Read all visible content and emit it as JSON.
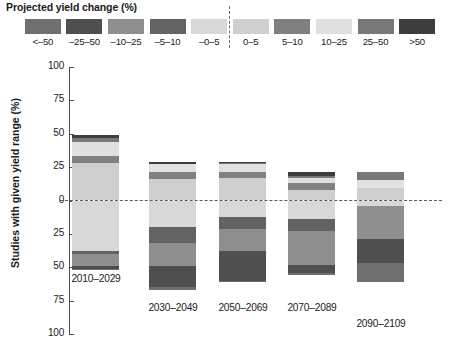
{
  "legend": {
    "title": "Projected yield change (%)",
    "classes": [
      {
        "label": "<–50",
        "color": "#6f6f6f"
      },
      {
        "label": "–25–50",
        "color": "#4f4f4f"
      },
      {
        "label": "–10–25",
        "color": "#8f8f8f"
      },
      {
        "label": "–5–10",
        "color": "#636363"
      },
      {
        "label": "–0–5",
        "color": "#d8d8d8"
      },
      {
        "label": "0–5",
        "color": "#cfcfcf"
      },
      {
        "label": "5–10",
        "color": "#808080"
      },
      {
        "label": "10–25",
        "color": "#e0e0e0"
      },
      {
        "label": "25–50",
        "color": "#787878"
      },
      {
        "label": ">50",
        "color": "#3d3d3d"
      }
    ],
    "divider": "dashed-separator"
  },
  "axes": {
    "ylabel": "Studies with given yield range (%)",
    "yticks": [
      "100",
      "75",
      "50",
      "25",
      "0",
      "25",
      "50",
      "75",
      "100"
    ],
    "ylim": [
      -100,
      100
    ],
    "zero_line": "0"
  },
  "chart_data": {
    "type": "bar",
    "title": "Projected yield change (%)",
    "xlabel": "",
    "ylabel": "Studies with given yield range (%)",
    "ylim": [
      -100,
      100
    ],
    "grid": false,
    "legend_position": "top",
    "stacked": true,
    "diverging": true,
    "note": "Positive values stack upward from 0 (yield increases); negative values stack downward from 0 (yield decreases).",
    "categories": [
      "2010–2029",
      "2030–2049",
      "2050–2069",
      "2070–2089",
      "2090–2109"
    ],
    "series": [
      {
        "name": ">50",
        "color": "#3d3d3d",
        "values": [
          2,
          2,
          1,
          3,
          0
        ]
      },
      {
        "name": "25–50",
        "color": "#787878",
        "values": [
          3,
          0,
          1,
          1,
          0
        ]
      },
      {
        "name": "10–25",
        "color": "#e0e0e0",
        "values": [
          11,
          6,
          6,
          4,
          6
        ]
      },
      {
        "name": "5–10",
        "color": "#808080",
        "values": [
          5,
          5,
          4,
          5,
          0
        ]
      },
      {
        "name": "0–5",
        "color": "#cfcfcf",
        "values": [
          28,
          16,
          17,
          8,
          9
        ]
      },
      {
        "name": "–0–5",
        "color": "#d8d8d8",
        "values": [
          -38,
          -20,
          -12,
          -14,
          -4
        ]
      },
      {
        "name": "–5–10",
        "color": "#636363",
        "values": [
          -2,
          -12,
          -9,
          -9,
          0
        ]
      },
      {
        "name": "–10–25",
        "color": "#8f8f8f",
        "values": [
          -9,
          -17,
          -17,
          -25,
          -25
        ]
      },
      {
        "name": "–25–50",
        "color": "#4f4f4f",
        "values": [
          -2,
          -16,
          -22,
          -6,
          -18
        ]
      },
      {
        "name": "<–50",
        "color": "#6f6f6f",
        "values": [
          -1,
          -2,
          -1,
          -2,
          -14
        ]
      }
    ],
    "bars": [
      {
        "category": "2010–2029",
        "positive_total": 49,
        "negative_total": 52,
        "positive_stack": [
          {
            "class": "0–5",
            "value": 28,
            "color": "#cfcfcf"
          },
          {
            "class": "5–10",
            "value": 5,
            "color": "#808080"
          },
          {
            "class": "10–25",
            "value": 11,
            "color": "#e0e0e0"
          },
          {
            "class": "25–50",
            "value": 3,
            "color": "#787878"
          },
          {
            "class": ">50",
            "value": 2,
            "color": "#3d3d3d"
          }
        ],
        "negative_stack": [
          {
            "class": "–0–5",
            "value": 38,
            "color": "#d8d8d8"
          },
          {
            "class": "–5–10",
            "value": 2,
            "color": "#636363"
          },
          {
            "class": "–10–25",
            "value": 9,
            "color": "#8f8f8f"
          },
          {
            "class": "–25–50",
            "value": 2,
            "color": "#4f4f4f"
          },
          {
            "class": "<–50",
            "value": 1,
            "color": "#6f6f6f"
          }
        ]
      },
      {
        "category": "2030–2049",
        "positive_total": 29,
        "negative_total": 67,
        "positive_stack": [
          {
            "class": "0–5",
            "value": 16,
            "color": "#cfcfcf"
          },
          {
            "class": "5–10",
            "value": 5,
            "color": "#808080"
          },
          {
            "class": "10–25",
            "value": 6,
            "color": "#e0e0e0"
          },
          {
            "class": ">50",
            "value": 2,
            "color": "#3d3d3d"
          }
        ],
        "negative_stack": [
          {
            "class": "–0–5",
            "value": 20,
            "color": "#d8d8d8"
          },
          {
            "class": "–5–10",
            "value": 12,
            "color": "#636363"
          },
          {
            "class": "–10–25",
            "value": 17,
            "color": "#8f8f8f"
          },
          {
            "class": "–25–50",
            "value": 16,
            "color": "#4f4f4f"
          },
          {
            "class": "<–50",
            "value": 2,
            "color": "#6f6f6f"
          }
        ]
      },
      {
        "category": "2050–2069",
        "positive_total": 29,
        "negative_total": 61,
        "positive_stack": [
          {
            "class": "0–5",
            "value": 17,
            "color": "#cfcfcf"
          },
          {
            "class": "5–10",
            "value": 4,
            "color": "#808080"
          },
          {
            "class": "10–25",
            "value": 6,
            "color": "#e0e0e0"
          },
          {
            "class": "25–50",
            "value": 1,
            "color": "#787878"
          },
          {
            "class": ">50",
            "value": 1,
            "color": "#3d3d3d"
          }
        ],
        "negative_stack": [
          {
            "class": "–0–5",
            "value": 12,
            "color": "#d8d8d8"
          },
          {
            "class": "–5–10",
            "value": 9,
            "color": "#636363"
          },
          {
            "class": "–10–25",
            "value": 17,
            "color": "#8f8f8f"
          },
          {
            "class": "–25–50",
            "value": 22,
            "color": "#4f4f4f"
          },
          {
            "class": "<–50",
            "value": 1,
            "color": "#6f6f6f"
          }
        ]
      },
      {
        "category": "2070–2089",
        "positive_total": 21,
        "negative_total": 56,
        "positive_stack": [
          {
            "class": "0–5",
            "value": 8,
            "color": "#cfcfcf"
          },
          {
            "class": "5–10",
            "value": 5,
            "color": "#808080"
          },
          {
            "class": "10–25",
            "value": 4,
            "color": "#e0e0e0"
          },
          {
            "class": "25–50",
            "value": 1,
            "color": "#787878"
          },
          {
            "class": ">50",
            "value": 3,
            "color": "#3d3d3d"
          }
        ],
        "negative_stack": [
          {
            "class": "–0–5",
            "value": 14,
            "color": "#d8d8d8"
          },
          {
            "class": "–5–10",
            "value": 9,
            "color": "#636363"
          },
          {
            "class": "–10–25",
            "value": 25,
            "color": "#8f8f8f"
          },
          {
            "class": "–25–50",
            "value": 6,
            "color": "#4f4f4f"
          },
          {
            "class": "<–50",
            "value": 2,
            "color": "#6f6f6f"
          }
        ]
      },
      {
        "category": "2090–2109",
        "positive_total": 21,
        "negative_total": 61,
        "positive_stack": [
          {
            "class": "0–5",
            "value": 9,
            "color": "#cfcfcf"
          },
          {
            "class": "10–25",
            "value": 6,
            "color": "#e0e0e0"
          },
          {
            "class": "25–50",
            "value": 6,
            "color": "#787878"
          }
        ],
        "negative_stack": [
          {
            "class": "–0–5",
            "value": 4,
            "color": "#d8d8d8"
          },
          {
            "class": "–10–25",
            "value": 25,
            "color": "#8f8f8f"
          },
          {
            "class": "–25–50",
            "value": 18,
            "color": "#4f4f4f"
          },
          {
            "class": "<–50",
            "value": 14,
            "color": "#6f6f6f"
          }
        ]
      }
    ]
  },
  "bar_layout": [
    {
      "x": 72,
      "label_y": 215,
      "label_offset_x": -36
    },
    {
      "x": 149,
      "label_y": 244,
      "label_offset_x": -36
    },
    {
      "x": 219,
      "label_y": 244,
      "label_offset_x": -36
    },
    {
      "x": 288,
      "label_y": 244,
      "label_offset_x": -36
    },
    {
      "x": 357,
      "label_y": 260,
      "label_offset_x": -36
    }
  ]
}
